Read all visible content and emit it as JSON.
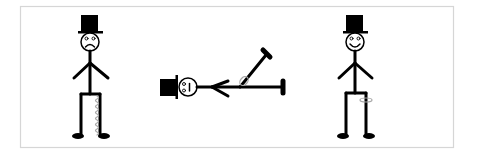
{
  "figure": {
    "panels": [
      {
        "id": "sad-figure",
        "mood": "sad",
        "detail": "coiled spring along right leg"
      },
      {
        "id": "fallen-figure",
        "mood": "dazed",
        "detail": "lying down with one leg raised, ring near hip"
      },
      {
        "id": "happy-figure",
        "mood": "happy",
        "detail": "ring around right leg"
      }
    ],
    "colors": {
      "ink": "#000000",
      "frame": "#d0d0d0",
      "spring": "#a8a8a8",
      "background": "#ffffff"
    }
  }
}
